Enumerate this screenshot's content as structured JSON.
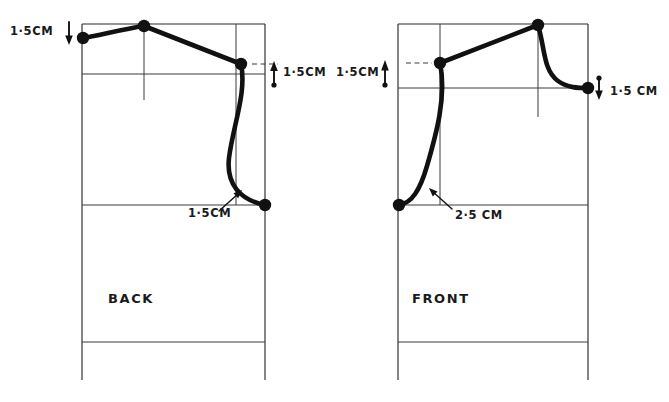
{
  "document": {
    "title": "Bodice block shoulder and armhole adjustment diagram",
    "kind": "hand-drawn sewing pattern drafting diagram",
    "background_color": "#ffffff",
    "ink_color": "#111111",
    "line_color": "#2b2b2b"
  },
  "pieces": [
    {
      "id": "back",
      "label": "BACK",
      "label_position": {
        "x": 108,
        "y": 303
      },
      "frame": {
        "x": 82,
        "y": 24,
        "width": 183,
        "height": 356,
        "bottom_open": true
      },
      "horizontal_guides": [
        {
          "name": "chest-line",
          "y": 74,
          "x1": 82,
          "x2": 265
        },
        {
          "name": "underarm-line",
          "y": 205,
          "x1": 82,
          "x2": 265
        },
        {
          "name": "hip-line",
          "y": 342,
          "x1": 82,
          "x2": 265
        }
      ],
      "vertical_guides": [
        {
          "name": "shoulder-centre-line",
          "x": 144,
          "y1": 24,
          "y2": 100
        },
        {
          "name": "armhole-guide-line",
          "x": 236,
          "y1": 24,
          "y2": 205
        }
      ],
      "dashed_ticks": [
        {
          "name": "shoulder-point-tick",
          "x1": 252,
          "y1": 64,
          "x2": 278,
          "y2": 64
        }
      ],
      "nodes": [
        {
          "name": "neck-point",
          "x": 83,
          "y": 38
        },
        {
          "name": "shoulder-apex-point",
          "x": 144,
          "y": 26
        },
        {
          "name": "shoulder-end-point",
          "x": 241,
          "y": 64
        },
        {
          "name": "underarm-point",
          "x": 265,
          "y": 205
        }
      ],
      "annotations": [
        {
          "name": "neck-drop-annotation",
          "text": "1·5CM",
          "text_x": 10,
          "text_y": 35,
          "arrow": {
            "direction": "down",
            "x": 69,
            "y1": 22,
            "y2": 42
          }
        },
        {
          "name": "shoulder-raise-annotation",
          "text": "1·5CM",
          "text_x": 283,
          "text_y": 76,
          "arrow": {
            "direction": "up",
            "x": 274,
            "y1": 84,
            "y2": 63
          }
        },
        {
          "name": "armhole-scoop-annotation",
          "text": "1·5CM",
          "text_x": 188,
          "text_y": 217,
          "leader": {
            "x1": 219,
            "y1": 211,
            "x2": 240,
            "y2": 192
          }
        }
      ]
    },
    {
      "id": "front",
      "label": "FRONT",
      "label_position": {
        "x": 412,
        "y": 303
      },
      "frame": {
        "x": 398,
        "y": 24,
        "width": 190,
        "height": 356,
        "bottom_open": true
      },
      "horizontal_guides": [
        {
          "name": "chest-line",
          "y": 88,
          "x1": 398,
          "x2": 588
        },
        {
          "name": "underarm-line",
          "y": 205,
          "x1": 398,
          "x2": 588
        },
        {
          "name": "hip-line",
          "y": 342,
          "x1": 398,
          "x2": 588
        }
      ],
      "vertical_guides": [
        {
          "name": "neck-guide-line",
          "x": 440,
          "y1": 24,
          "y2": 205
        },
        {
          "name": "armhole-guide-line",
          "x": 538,
          "y1": 24,
          "y2": 117
        },
        {
          "name": "side-seam-guide-line",
          "x": 588,
          "y1": 24,
          "y2": 380
        }
      ],
      "dashed_ticks": [
        {
          "name": "neck-point-tick",
          "x1": 406,
          "y1": 63,
          "x2": 432,
          "y2": 63
        }
      ],
      "nodes": [
        {
          "name": "neck-point",
          "x": 440,
          "y": 63
        },
        {
          "name": "shoulder-apex-point",
          "x": 538,
          "y": 25
        },
        {
          "name": "shoulder-end-point",
          "x": 588,
          "y": 88
        },
        {
          "name": "underarm-point",
          "x": 399,
          "y": 205
        }
      ],
      "annotations": [
        {
          "name": "neck-raise-annotation",
          "text": "1·5CM",
          "text_x": 336,
          "text_y": 76,
          "arrow": {
            "direction": "up",
            "x": 385,
            "y1": 84,
            "y2": 62
          }
        },
        {
          "name": "shoulder-drop-annotation",
          "text": "1·5 CM",
          "text_x": 610,
          "text_y": 95,
          "arrow": {
            "direction": "down",
            "x": 599,
            "y1": 79,
            "y2": 98
          }
        },
        {
          "name": "armhole-scoop-annotation",
          "text": "2·5 CM",
          "text_x": 455,
          "text_y": 219,
          "leader": {
            "x1": 452,
            "y1": 209,
            "x2": 431,
            "y2": 190
          }
        }
      ]
    }
  ],
  "measurements": [
    {
      "piece": "back",
      "name": "neck-drop",
      "value": "1·5CM",
      "direction": "down"
    },
    {
      "piece": "back",
      "name": "shoulder-raise",
      "value": "1·5CM",
      "direction": "up"
    },
    {
      "piece": "back",
      "name": "armhole-scoop",
      "value": "1·5CM",
      "direction": "inward"
    },
    {
      "piece": "front",
      "name": "neck-raise",
      "value": "1·5CM",
      "direction": "up"
    },
    {
      "piece": "front",
      "name": "shoulder-drop",
      "value": "1·5 CM",
      "direction": "down"
    },
    {
      "piece": "front",
      "name": "armhole-scoop",
      "value": "2·5 CM",
      "direction": "inward"
    }
  ]
}
